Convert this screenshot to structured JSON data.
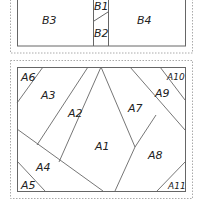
{
  "diagram": {
    "top_panel": {
      "name": "pattern-b",
      "pieces": [
        {
          "id": "B1",
          "label": "B1"
        },
        {
          "id": "B2",
          "label": "B2"
        },
        {
          "id": "B3",
          "label": "B3"
        },
        {
          "id": "B4",
          "label": "B4"
        }
      ]
    },
    "bottom_panel": {
      "name": "pattern-a",
      "pieces": [
        {
          "id": "A1",
          "label": "A1"
        },
        {
          "id": "A2",
          "label": "A2"
        },
        {
          "id": "A3",
          "label": "A3"
        },
        {
          "id": "A4",
          "label": "A4"
        },
        {
          "id": "A5",
          "label": "A5"
        },
        {
          "id": "A6",
          "label": "A6"
        },
        {
          "id": "A7",
          "label": "A7"
        },
        {
          "id": "A8",
          "label": "A8"
        },
        {
          "id": "A9",
          "label": "A9"
        },
        {
          "id": "A10",
          "label": "A10"
        },
        {
          "id": "A11",
          "label": "A11"
        }
      ]
    },
    "colors": {
      "line": "#555555",
      "dashed": "#aaaaaa",
      "text": "#222222"
    }
  }
}
